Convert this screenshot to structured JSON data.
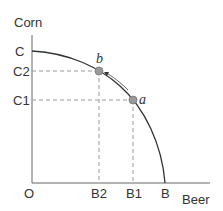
{
  "diagram": {
    "type": "production-possibilities-frontier",
    "axes": {
      "y_label": "Corn",
      "x_label": "Beer",
      "origin_label": "O"
    },
    "y_ticks": [
      {
        "label": "C",
        "y": 51
      },
      {
        "label": "C2",
        "y": 71
      },
      {
        "label": "C1",
        "y": 100
      }
    ],
    "x_ticks": [
      {
        "label": "B2",
        "x": 99
      },
      {
        "label": "B1",
        "x": 133
      },
      {
        "label": "B",
        "x": 165
      }
    ],
    "points": [
      {
        "label": "b",
        "x": 99,
        "y": 71
      },
      {
        "label": "a",
        "x": 133,
        "y": 100
      }
    ],
    "arrow": {
      "from": "a",
      "to": "b"
    },
    "colors": {
      "line": "#333333",
      "dashed": "#999999",
      "point_fill": "#999999",
      "arrow": "#555555"
    }
  }
}
